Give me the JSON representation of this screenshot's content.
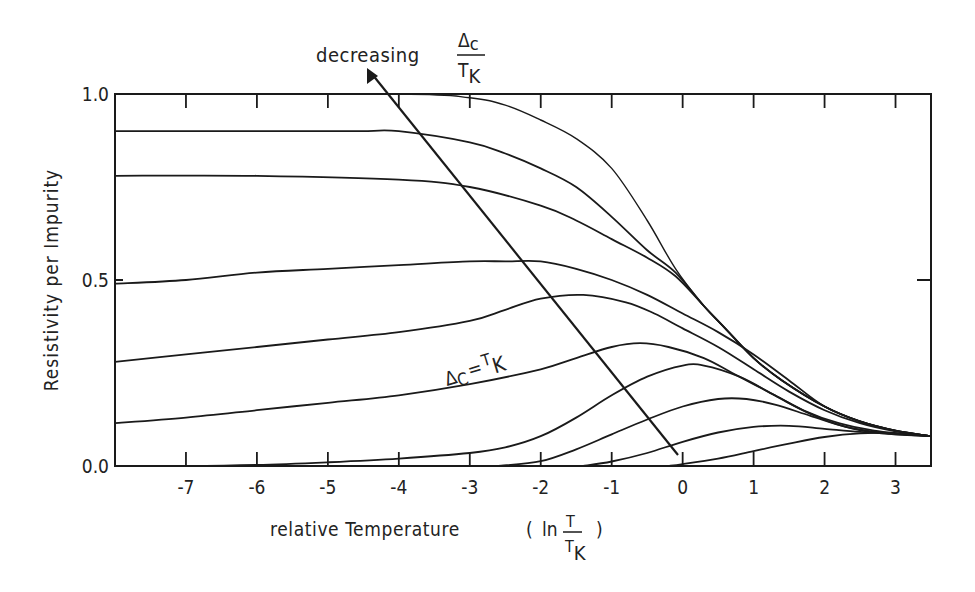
{
  "chart_data": {
    "type": "line",
    "title": "",
    "xlabel": "relative Temperature",
    "xlabel_math": {
      "prefix": "( ln",
      "numerator": "T",
      "denominator": "T",
      "denominator_sub": "K",
      "suffix": ")"
    },
    "ylabel": "Resistivity per Impurity",
    "xlim": [
      -8,
      3.5
    ],
    "ylim": [
      0,
      1
    ],
    "xticks": [
      -7,
      -6,
      -5,
      -4,
      -3,
      -2,
      -1,
      0,
      1,
      2,
      3
    ],
    "xtick_labels": [
      "-7",
      "-6",
      "-5",
      "-4",
      "-3",
      "-2",
      "-1",
      "0",
      "1",
      "2",
      "3"
    ],
    "yticks": [
      0,
      0.5,
      1
    ],
    "ytick_labels": [
      "0.0",
      "0.5",
      "1.0"
    ],
    "grid": false,
    "legend": null,
    "annotations": [
      {
        "text": "decreasing",
        "fraction": {
          "numerator": "Δ",
          "numerator_sub": "c",
          "denominator": "T",
          "denominator_sub": "K"
        },
        "position": [
          -5.1,
          1.08
        ]
      },
      {
        "text": "Δ",
        "sub": "c",
        "eq": " = T",
        "sub2": "K",
        "label": "Δc = TK",
        "position": [
          -3.4,
          0.27
        ],
        "rotation": -16
      }
    ],
    "arrow": {
      "from": [
        -0.2,
        0.03
      ],
      "to": [
        -4.95,
        1.07
      ]
    },
    "series": [
      {
        "name": "curve-1",
        "x": [
          -8,
          -4,
          -3,
          -2.5,
          -2,
          -1.5,
          -1,
          -0.5,
          -0.1,
          0.3,
          0.6,
          1,
          1.4,
          2,
          2.5,
          3,
          3.5
        ],
        "y": [
          1.0,
          1.0,
          0.99,
          0.97,
          0.93,
          0.88,
          0.8,
          0.66,
          0.53,
          0.43,
          0.37,
          0.29,
          0.23,
          0.16,
          0.12,
          0.095,
          0.08
        ]
      },
      {
        "name": "curve-2",
        "x": [
          -8,
          -5,
          -4.5,
          -4,
          -3,
          -2.5,
          -2,
          -1.5,
          -1,
          -0.5,
          -0.1,
          0.3,
          0.6,
          1,
          1.4,
          2,
          2.5,
          3,
          3.5
        ],
        "y": [
          0.9,
          0.9,
          0.9,
          0.9,
          0.87,
          0.84,
          0.8,
          0.75,
          0.67,
          0.58,
          0.52,
          0.43,
          0.37,
          0.29,
          0.23,
          0.16,
          0.12,
          0.095,
          0.08
        ]
      },
      {
        "name": "curve-3",
        "x": [
          -8,
          -6,
          -4,
          -3,
          -2,
          -1.5,
          -1,
          -0.5,
          -0.1,
          0.3,
          0.6,
          1,
          1.4,
          2,
          2.5,
          3,
          3.5
        ],
        "y": [
          0.78,
          0.78,
          0.77,
          0.75,
          0.7,
          0.66,
          0.61,
          0.56,
          0.51,
          0.43,
          0.37,
          0.29,
          0.23,
          0.16,
          0.12,
          0.095,
          0.08
        ]
      },
      {
        "name": "curve-4",
        "x": [
          -8,
          -7,
          -6,
          -5,
          -4,
          -3,
          -2.5,
          -2,
          -1.5,
          -1,
          -0.5,
          0,
          0.5,
          1,
          1.5,
          2,
          2.5,
          3,
          3.5
        ],
        "y": [
          0.49,
          0.5,
          0.52,
          0.53,
          0.54,
          0.55,
          0.55,
          0.55,
          0.53,
          0.5,
          0.46,
          0.41,
          0.36,
          0.3,
          0.23,
          0.16,
          0.12,
          0.095,
          0.08
        ]
      },
      {
        "name": "curve-5",
        "x": [
          -8,
          -7,
          -6,
          -5,
          -4,
          -3,
          -2.5,
          -2,
          -1.4,
          -0.8,
          -0.4,
          0,
          0.5,
          1,
          1.5,
          2,
          2.5,
          3,
          3.5
        ],
        "y": [
          0.28,
          0.3,
          0.32,
          0.34,
          0.36,
          0.39,
          0.42,
          0.45,
          0.46,
          0.44,
          0.41,
          0.37,
          0.32,
          0.26,
          0.2,
          0.15,
          0.115,
          0.093,
          0.08
        ]
      },
      {
        "name": "curve-6",
        "x": [
          -8,
          -7,
          -6,
          -5,
          -4,
          -3,
          -2,
          -1.5,
          -1,
          -0.6,
          -0.2,
          0.3,
          0.7,
          1.2,
          1.7,
          2.2,
          2.7,
          3.1,
          3.5
        ],
        "y": [
          0.115,
          0.13,
          0.15,
          0.17,
          0.19,
          0.22,
          0.26,
          0.29,
          0.32,
          0.33,
          0.32,
          0.29,
          0.25,
          0.2,
          0.15,
          0.115,
          0.095,
          0.087,
          0.08
        ]
      },
      {
        "name": "curve-7",
        "x": [
          -8,
          -7,
          -6,
          -5,
          -4,
          -3,
          -2.5,
          -2,
          -1.5,
          -1,
          -0.5,
          0,
          0.3,
          0.8,
          1.3,
          1.8,
          2.3,
          2.8,
          3.5
        ],
        "y": [
          0.0,
          0.0,
          0.003,
          0.01,
          0.02,
          0.035,
          0.05,
          0.08,
          0.13,
          0.19,
          0.24,
          0.27,
          0.27,
          0.24,
          0.19,
          0.14,
          0.105,
          0.088,
          0.08
        ]
      },
      {
        "name": "curve-8",
        "x": [
          -2.6,
          -2,
          -1.5,
          -1,
          -0.5,
          0,
          0.5,
          0.9,
          1.3,
          1.8,
          2.3,
          2.8,
          3.5
        ],
        "y": [
          0.0,
          0.013,
          0.045,
          0.085,
          0.125,
          0.16,
          0.18,
          0.18,
          0.165,
          0.135,
          0.105,
          0.09,
          0.08
        ]
      },
      {
        "name": "curve-9",
        "x": [
          -1.4,
          -1,
          -0.5,
          0,
          0.5,
          1,
          1.5,
          2,
          2.5,
          3,
          3.5
        ],
        "y": [
          0.0,
          0.012,
          0.035,
          0.065,
          0.09,
          0.105,
          0.108,
          0.1,
          0.092,
          0.087,
          0.08
        ]
      },
      {
        "name": "curve-10",
        "x": [
          -0.2,
          0,
          0.5,
          1,
          1.5,
          2,
          2.5,
          3,
          3.5
        ],
        "y": [
          0.0,
          0.005,
          0.02,
          0.04,
          0.06,
          0.078,
          0.088,
          0.088,
          0.08
        ]
      }
    ]
  },
  "labels": {
    "ylabel": "Resistivity per Impurity",
    "xlabel_text": "relative Temperature",
    "xlabel_paren_open": "(",
    "xlabel_ln": "ln",
    "xlabel_num": "T",
    "xlabel_den": "T",
    "xlabel_den_sub": "K",
    "xlabel_paren_close": ")",
    "top_annot_text": "decreasing",
    "top_annot_num": "Δ",
    "top_annot_num_sub": "c",
    "top_annot_den": "T",
    "top_annot_den_sub": "K",
    "curve_annot_delta": "Δ",
    "curve_annot_delta_sub": "C",
    "curve_annot_eq": "=",
    "curve_annot_t": "T",
    "curve_annot_t_sub": "K"
  }
}
